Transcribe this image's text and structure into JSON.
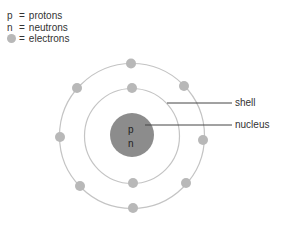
{
  "legend": {
    "items": [
      {
        "symbol": "p",
        "equals": "=",
        "label": "protons"
      },
      {
        "symbol": "n",
        "equals": "=",
        "label": "neutrons"
      },
      {
        "symbol": "electron-dot",
        "equals": "=",
        "label": "electrons"
      }
    ]
  },
  "nucleus": {
    "line1": "p",
    "line2": "n"
  },
  "labels": {
    "shell": "shell",
    "nucleus": "nucleus"
  },
  "colors": {
    "nucleus": "#8c8c8c",
    "electron": "#b8b8b8",
    "shell": "#c4c4c4",
    "leader_line": "#444444"
  },
  "electrons": {
    "inner_shell_count": 2,
    "outer_shell_count": 8
  }
}
